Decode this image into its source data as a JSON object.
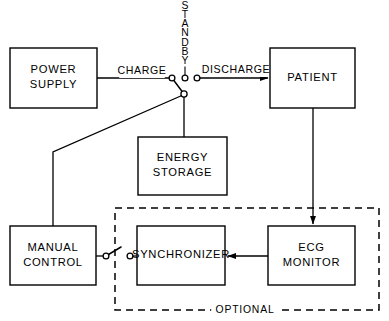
{
  "diagram": {
    "stroke_color": "#000000",
    "background_color": "#ffffff",
    "boxes": [
      {
        "id": "power_supply",
        "lines": [
          "POWER",
          "SUPPLY"
        ],
        "x": 10,
        "y": 48,
        "w": 87,
        "h": 60
      },
      {
        "id": "patient",
        "lines": [
          "PATIENT"
        ],
        "x": 270,
        "y": 48,
        "w": 85,
        "h": 60
      },
      {
        "id": "energy_storage",
        "lines": [
          "ENERGY",
          "STORAGE"
        ],
        "x": 138,
        "y": 137,
        "w": 89,
        "h": 58
      },
      {
        "id": "manual_control",
        "lines": [
          "MANUAL",
          "CONTROL"
        ],
        "x": 10,
        "y": 226,
        "w": 86,
        "h": 59
      },
      {
        "id": "synchronizer",
        "lines": [
          "SYNCHRONIZER"
        ],
        "x": 137,
        "y": 226,
        "w": 88,
        "h": 59
      },
      {
        "id": "ecg_monitor",
        "lines": [
          "ECG",
          "MONITOR"
        ],
        "x": 268,
        "y": 226,
        "w": 87,
        "h": 59
      }
    ],
    "flow_labels": [
      {
        "id": "charge",
        "text": "CHARGE",
        "x": 142,
        "y": 71
      },
      {
        "id": "discharge",
        "text": "DISCHARGE",
        "x": 236,
        "y": 70
      }
    ],
    "standby": {
      "text": "STANDBY",
      "letters": [
        "S",
        "T",
        "A",
        "N",
        "D",
        "B",
        "Y"
      ],
      "x": 185,
      "y_start": 6,
      "line_height": 9.2
    },
    "optional": {
      "text": "OPTIONAL",
      "x": 245,
      "y": 310
    },
    "dashed_region": {
      "id": "optional-region",
      "x": 115,
      "y": 208,
      "w": 264,
      "h": 102
    },
    "switches": [
      {
        "id": "mode-switch",
        "contacts": [
          {
            "id": "charge-contact",
            "cx": 172,
            "cy": 78,
            "r": 2.9
          },
          {
            "id": "standby-contact",
            "cx": 185,
            "cy": 78,
            "r": 2.9
          },
          {
            "id": "discharge-contact",
            "cx": 197,
            "cy": 78,
            "r": 2.9
          },
          {
            "id": "energy-contact",
            "cx": 184,
            "cy": 94,
            "r": 3.1
          }
        ],
        "lever": {
          "x1": 172,
          "y1": 78,
          "x2": 184,
          "y2": 94
        }
      },
      {
        "id": "sync-switch",
        "contacts": [
          {
            "id": "manual-contact",
            "cx": 106,
            "cy": 256,
            "r": 2.9
          },
          {
            "id": "synchronizer-contact",
            "cx": 130,
            "cy": 256,
            "r": 2.9
          }
        ],
        "lever": {
          "x1": 106,
          "y1": 256,
          "x2": 121,
          "y2": 247
        }
      }
    ],
    "connections": [
      {
        "id": "power-to-charge",
        "path": "M 97 78 L 169 78",
        "arrow": false
      },
      {
        "id": "discharge-to-patient",
        "path": "M 200 78 L 268 78",
        "arrow": true
      },
      {
        "id": "switch-to-energy",
        "path": "M 184 97 L 184 137",
        "arrow": false
      },
      {
        "id": "switch-to-manual",
        "path": "M 183 95 L 53 152 L 53 226",
        "arrow": false
      },
      {
        "id": "patient-to-ecg",
        "path": "M 313 108 L 313 224",
        "arrow": true
      },
      {
        "id": "ecg-to-synchronizer",
        "path": "M 268 256 L 228 256",
        "arrow": true
      },
      {
        "id": "manual-to-switch",
        "path": "M 96 256 L 103 256",
        "arrow": false
      },
      {
        "id": "switch-to-synchronizer",
        "path": "M 133 256 L 137 256",
        "arrow": false
      }
    ]
  }
}
